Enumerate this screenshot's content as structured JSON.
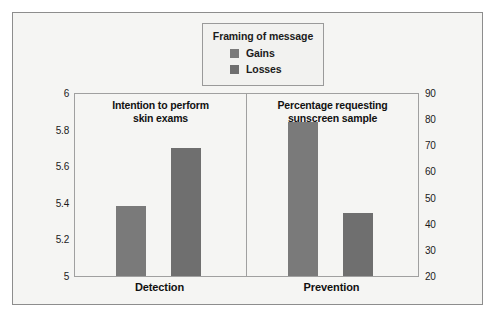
{
  "legend": {
    "title": "Framing of message",
    "entries": [
      {
        "label": "Gains",
        "color": "#7a7a7a"
      },
      {
        "label": "Losses",
        "color": "#6f6f6f"
      }
    ]
  },
  "panels": [
    {
      "title_line1": "Intention to perform",
      "title_line2": "skin exams",
      "category": "Detection"
    },
    {
      "title_line1": "Percentage requesting",
      "title_line2": "sunscreen sample",
      "category": "Prevention"
    }
  ],
  "axes": {
    "left_ticks": [
      "6",
      "5.8",
      "5.6",
      "5.4",
      "5.2",
      "5"
    ],
    "right_ticks": [
      "90",
      "80",
      "70",
      "60",
      "50",
      "40",
      "30",
      "20"
    ]
  },
  "chart_data": {
    "type": "bar",
    "title": "",
    "categories": [
      "Detection",
      "Prevention"
    ],
    "panels": [
      {
        "title": "Intention to perform skin exams",
        "category": "Detection",
        "ylabel": "",
        "ylim": [
          5,
          6
        ],
        "yticks": [
          5,
          5.2,
          5.4,
          5.6,
          5.8,
          6
        ],
        "series": [
          {
            "name": "Gains",
            "value": 5.38
          },
          {
            "name": "Losses",
            "value": 5.7
          }
        ]
      },
      {
        "title": "Percentage requesting sunscreen sample",
        "category": "Prevention",
        "ylabel": "",
        "ylim": [
          20,
          90
        ],
        "yticks": [
          20,
          30,
          40,
          50,
          60,
          70,
          80,
          90
        ],
        "series": [
          {
            "name": "Gains",
            "value": 79
          },
          {
            "name": "Losses",
            "value": 44
          }
        ]
      }
    ],
    "legend_entries": [
      "Gains",
      "Losses"
    ],
    "legend_position": "top-center",
    "legend_title": "Framing of message",
    "grid": false,
    "xlabel": "",
    "ylabel": ""
  },
  "colors": {
    "bar_gains": "#7a7a7a",
    "bar_losses": "#6f6f6f",
    "frame": "#8d8d8d",
    "background": "#f5f5f3"
  }
}
